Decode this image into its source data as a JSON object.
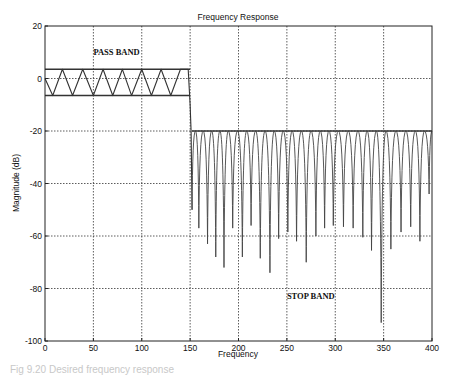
{
  "chart_data": {
    "type": "line",
    "title": "Frequency Response",
    "xlabel": "Frequency",
    "ylabel": "Magnitude (dB)",
    "xlim": [
      0,
      400
    ],
    "ylim": [
      -100,
      20
    ],
    "xticks": [
      0,
      50,
      100,
      150,
      200,
      250,
      300,
      350,
      400
    ],
    "yticks": [
      20,
      0,
      -20,
      -40,
      -60,
      -80,
      -100
    ],
    "grid": true,
    "legend": "none",
    "annotations": [
      {
        "text": "PASS BAND",
        "x": 50,
        "y": 9
      },
      {
        "text": "STOP BAND",
        "x": 250,
        "y": -84
      }
    ],
    "reference_lines": [
      {
        "name": "passband-upper-bound",
        "y": 3.5,
        "x_range": [
          0,
          150
        ]
      },
      {
        "name": "passband-lower-bound",
        "y": -6.5,
        "x_range": [
          0,
          150
        ]
      },
      {
        "name": "stopband-upper-bound",
        "y": -20,
        "x_range": [
          152,
          400
        ]
      }
    ],
    "series": [
      {
        "name": "Passband ripple",
        "x": [
          0,
          8,
          18,
          28.5,
          39,
          50,
          60,
          70,
          80,
          89.5,
          100,
          110,
          120,
          130,
          140,
          148,
          150,
          151,
          152
        ],
        "y": [
          0,
          -6.5,
          3.5,
          -6.5,
          3.5,
          -6.5,
          3.5,
          -6.5,
          3.5,
          -6.5,
          3.5,
          -6.5,
          3.5,
          -6.5,
          3.5,
          3.5,
          -10,
          -20,
          -50
        ]
      },
      {
        "name": "Stopband nulls",
        "x": [
          152,
          159,
          168,
          176.5,
          185,
          194,
          204,
          213,
          222.5,
          232.5,
          241.5,
          251,
          260,
          270,
          280,
          289,
          298,
          308.5,
          318.5,
          328.5,
          337.5,
          347.5,
          357.5,
          368,
          378,
          387.5,
          397
        ],
        "y": [
          -50,
          -57,
          -63,
          -68,
          -72,
          -57,
          -68,
          -56,
          -68.5,
          -74,
          -61,
          -58.5,
          -62,
          -70,
          -60,
          -57,
          -56,
          -56.5,
          -57,
          -60.5,
          -65.5,
          -93,
          -65,
          -58.5,
          -56.5,
          -62,
          -44
        ]
      }
    ]
  },
  "caption": "Fig 9.20  Desired frequency response"
}
